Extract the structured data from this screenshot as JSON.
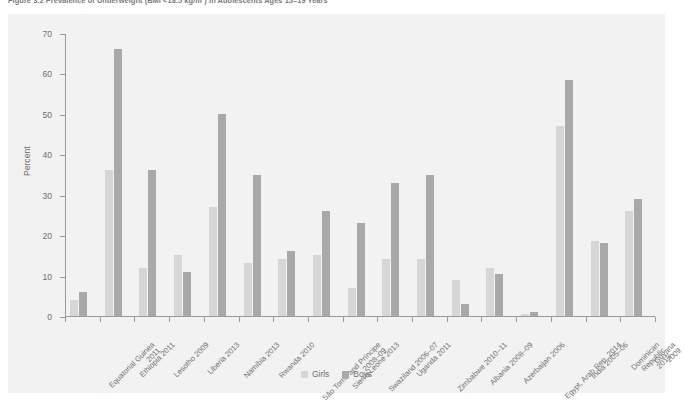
{
  "figure": {
    "caption": "Figure 3.2  Prevalence of Underweight (BMI <18.5 kg/m²) in Adolescents Ages 15–19 Years"
  },
  "legend": {
    "girls_label": "Girls",
    "boys_label": "Boys"
  },
  "colors": {
    "girls": "#d6d6d6",
    "boys": "#a9a9a9",
    "plot_background": "#f2f2f2",
    "axis": "#9a9a9a",
    "text": "#6f6f6f"
  },
  "chart_data": {
    "type": "bar",
    "title": "Figure 3.2  Prevalence of Underweight (BMI <18.5 kg/m²) in Adolescents Ages 15–19 Years",
    "xlabel": "",
    "ylabel": "Percent",
    "ylim": [
      0,
      70
    ],
    "yticks": [
      0,
      10,
      20,
      30,
      40,
      50,
      60,
      70
    ],
    "grid": false,
    "legend_position": "bottom-center",
    "categories": [
      "Equatorial Guinea\n2011",
      "Ethiopia 2011",
      "Lesotho 2009",
      "Liberia 2013",
      "Namibia 2013",
      "Rwanda 2010",
      "São Tomé and Príncipe\n2008–09",
      "Sierra Leone 2013",
      "Swaziland 2006–07",
      "Uganda 2011",
      "Zimbabwe 2010–11",
      "Albania 2008–09",
      "Azerbaijan 2006",
      "Egypt, Arab Rep. 2014",
      "India 2005–06",
      "Dominican Republic 2013",
      "Guyana 2009"
    ],
    "series": [
      {
        "name": "Girls",
        "color": "#d6d6d6",
        "values": [
          4,
          36,
          12,
          15,
          27,
          13,
          14,
          15,
          7,
          14,
          14,
          9,
          12,
          0.5,
          47,
          18.5,
          26
        ]
      },
      {
        "name": "Boys",
        "color": "#a9a9a9",
        "values": [
          6,
          66,
          36,
          11,
          50,
          35,
          16,
          26,
          23,
          33,
          35,
          3,
          10.5,
          1,
          58.5,
          18,
          29
        ]
      }
    ]
  }
}
